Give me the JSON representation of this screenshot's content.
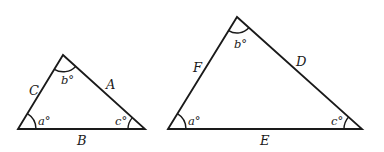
{
  "diagram": {
    "type": "two-triangles",
    "triangles": [
      {
        "id": "small",
        "vertices": {
          "left": [
            18,
            129
          ],
          "top": [
            63,
            55
          ],
          "right": [
            145,
            129
          ]
        },
        "sides": {
          "left": "C",
          "right": "A",
          "bottom": "B"
        },
        "angles": {
          "left": "a°",
          "top": "b°",
          "right": "c°"
        }
      },
      {
        "id": "large",
        "vertices": {
          "left": [
            168,
            129
          ],
          "top": [
            237,
            17
          ],
          "right": [
            362,
            129
          ]
        },
        "sides": {
          "left": "F",
          "right": "D",
          "bottom": "E"
        },
        "angles": {
          "left": "a°",
          "top": "b°",
          "right": "c°"
        }
      }
    ],
    "colors": {
      "stroke": "#1a1a1a",
      "background": "#ffffff"
    }
  }
}
